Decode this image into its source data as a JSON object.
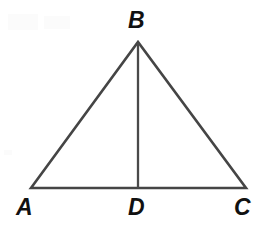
{
  "figure": {
    "kind": "geometry-diagram",
    "shape_name": "triangle",
    "background_color": "#ffffff",
    "stroke_color": "#454545",
    "label_color": "#111111",
    "canvas": {
      "width": 271,
      "height": 232
    }
  },
  "labels": {
    "apex": "B",
    "base_left": "A",
    "base_mid": "D",
    "base_right": "C"
  },
  "points": {
    "A": {
      "x": 31,
      "y": 188
    },
    "B": {
      "x": 138,
      "y": 42
    },
    "C": {
      "x": 246,
      "y": 188
    },
    "D": {
      "x": 138,
      "y": 188
    }
  },
  "segments": [
    {
      "name": "AB",
      "from": "A",
      "to": "B",
      "kind": "triangle-side"
    },
    {
      "name": "BC",
      "from": "B",
      "to": "C",
      "kind": "triangle-side"
    },
    {
      "name": "AC",
      "from": "A",
      "to": "C",
      "kind": "triangle-base"
    },
    {
      "name": "BD",
      "from": "B",
      "to": "D",
      "kind": "cevian"
    }
  ],
  "geometry_notes": {
    "triangle_path": "M 31 188 L 138 42 L 246 188 Z",
    "cevian_path": "M 138 43 L 138 188"
  }
}
